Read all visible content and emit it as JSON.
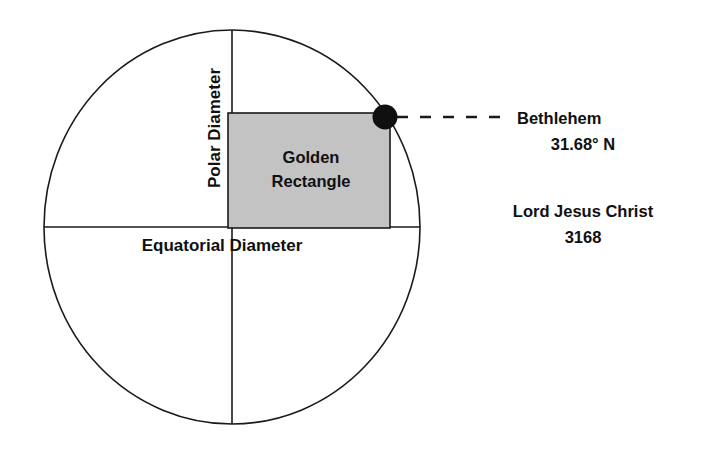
{
  "figure": {
    "title_hidden": "",
    "background_color": "#ffffff",
    "stroke_color": "#1a1a1a",
    "rectangle_fill": "#c3c3c3",
    "marker_color": "#101010"
  },
  "axes": {
    "polar_label": "Polar Diameter",
    "equatorial_label": "Equatorial Diameter"
  },
  "rectangle": {
    "line1": "Golden",
    "line2": "Rectangle"
  },
  "callout": {
    "city": "Bethlehem",
    "latitude": "31.68° N"
  },
  "annotation": {
    "line1": "Lord Jesus Christ",
    "line2": "3168"
  },
  "geometry": {
    "circle_center_x": 232,
    "circle_center_y": 227,
    "circle_radius_x": 188,
    "circle_radius_y": 197,
    "rect_left": 228,
    "rect_top": 113,
    "rect_right": 390,
    "rect_bottom": 228,
    "marker_x": 385,
    "marker_y": 117,
    "marker_radius": 12.5
  }
}
